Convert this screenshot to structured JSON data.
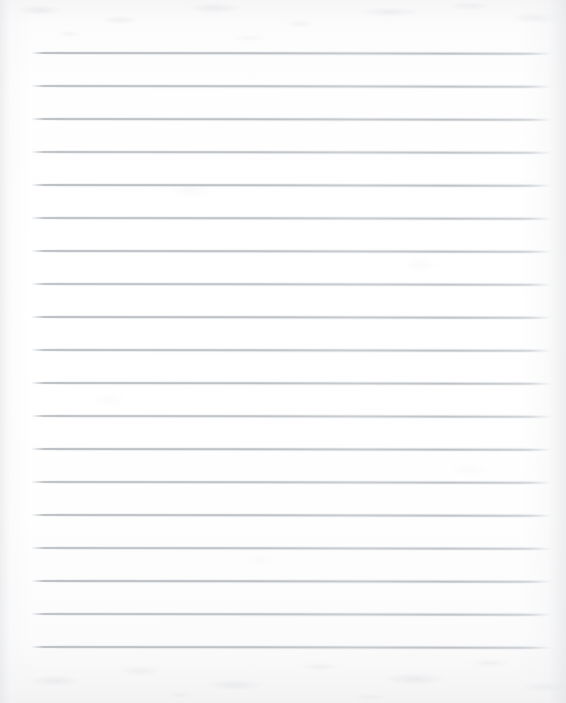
{
  "document": {
    "kind": "scanned-lined-paper",
    "title": "Blank Ruled Notebook Page",
    "content_text": "",
    "handwriting": "",
    "page_number": "",
    "width_px": 566,
    "height_px": 703
  },
  "paper": {
    "background_color": "#fefefe",
    "edge_tint_color": "#f2f2f3",
    "texture": "mottled scan grain at top and bottom edges",
    "orientation": "portrait"
  },
  "rules": {
    "count": 19,
    "color": "#b9bdc1",
    "halo_color": "#d6d9dd",
    "thickness_px": 2,
    "first_line_y": 53,
    "spacing_px": 33,
    "left_x": 31,
    "right_x": 552,
    "tilt_note": "very slight downward tilt left-to-right from scan skew",
    "lines": [
      {
        "index": 1,
        "y": 53,
        "x1": 31,
        "x2": 552,
        "opacity": 0.92
      },
      {
        "index": 2,
        "y": 86,
        "x1": 31,
        "x2": 552,
        "opacity": 0.88
      },
      {
        "index": 3,
        "y": 119,
        "x1": 31,
        "x2": 552,
        "opacity": 0.9
      },
      {
        "index": 4,
        "y": 152,
        "x1": 31,
        "x2": 552,
        "opacity": 0.86
      },
      {
        "index": 5,
        "y": 185,
        "x1": 31,
        "x2": 552,
        "opacity": 0.92
      },
      {
        "index": 6,
        "y": 218,
        "x1": 31,
        "x2": 552,
        "opacity": 0.88
      },
      {
        "index": 7,
        "y": 251,
        "x1": 31,
        "x2": 552,
        "opacity": 0.9
      },
      {
        "index": 8,
        "y": 284,
        "x1": 31,
        "x2": 552,
        "opacity": 0.86
      },
      {
        "index": 9,
        "y": 317,
        "x1": 31,
        "x2": 552,
        "opacity": 0.92
      },
      {
        "index": 10,
        "y": 350,
        "x1": 31,
        "x2": 552,
        "opacity": 0.88
      },
      {
        "index": 11,
        "y": 383,
        "x1": 31,
        "x2": 552,
        "opacity": 0.9
      },
      {
        "index": 12,
        "y": 416,
        "x1": 31,
        "x2": 552,
        "opacity": 0.86
      },
      {
        "index": 13,
        "y": 449,
        "x1": 31,
        "x2": 552,
        "opacity": 0.92
      },
      {
        "index": 14,
        "y": 482,
        "x1": 31,
        "x2": 552,
        "opacity": 0.88
      },
      {
        "index": 15,
        "y": 515,
        "x1": 31,
        "x2": 552,
        "opacity": 0.9
      },
      {
        "index": 16,
        "y": 548,
        "x1": 31,
        "x2": 552,
        "opacity": 0.86
      },
      {
        "index": 17,
        "y": 581,
        "x1": 31,
        "x2": 552,
        "opacity": 0.92
      },
      {
        "index": 18,
        "y": 614,
        "x1": 31,
        "x2": 552,
        "opacity": 0.88
      },
      {
        "index": 19,
        "y": 647,
        "x1": 31,
        "x2": 552,
        "opacity": 0.9
      }
    ]
  }
}
